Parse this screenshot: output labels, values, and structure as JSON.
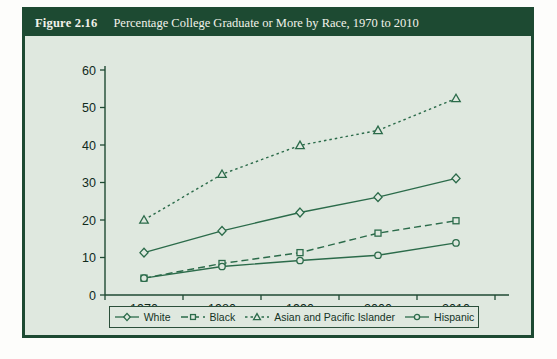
{
  "figure": {
    "number": "Figure 2.16",
    "title": "Percentage College Graduate or More by Race, 1970 to 2010"
  },
  "colors": {
    "header_bg": "#1d4a32",
    "header_text": "#f2f2ea",
    "panel_bg": "#dfe8df",
    "line": "#2b6b4a",
    "axis": "#1f4a33",
    "page_bg": "#fdfdfb"
  },
  "legend": {
    "position": "bottom",
    "entries": [
      {
        "label": "White",
        "marker": "diamond",
        "line_style": "solid"
      },
      {
        "label": "Black",
        "marker": "square",
        "line_style": "dashed"
      },
      {
        "label": "Asian and Pacific Islander",
        "marker": "triangle",
        "line_style": "dotted"
      },
      {
        "label": "Hispanic",
        "marker": "circle",
        "line_style": "solid"
      }
    ]
  },
  "chart_data": {
    "type": "line",
    "title": "Percentage College Graduate or More by Race, 1970 to 2010",
    "xlabel": "",
    "ylabel": "",
    "x": [
      1970,
      1980,
      1990,
      2000,
      2010
    ],
    "categories": [
      "1970",
      "1980",
      "1990",
      "2000",
      "2010"
    ],
    "xtick_labels": [
      "1970",
      "1980",
      "1990",
      "2000",
      "2010"
    ],
    "ytick_labels": [
      "0",
      "10",
      "20",
      "30",
      "40",
      "50",
      "60"
    ],
    "yticks": [
      0,
      10,
      20,
      30,
      40,
      50,
      60
    ],
    "ylim": [
      0,
      60
    ],
    "xlim": [
      1965,
      2015
    ],
    "grid": false,
    "legend_position": "bottom",
    "series": [
      {
        "name": "White",
        "marker": "diamond",
        "line_style": "solid",
        "values": [
          11.3,
          17.1,
          22.0,
          26.1,
          31.1
        ]
      },
      {
        "name": "Black",
        "marker": "square",
        "line_style": "dashed",
        "values": [
          4.5,
          8.4,
          11.3,
          16.5,
          19.8
        ]
      },
      {
        "name": "Asian and Pacific Islander",
        "marker": "triangle",
        "line_style": "dotted",
        "values": [
          20.0,
          32.2,
          39.9,
          43.9,
          52.4
        ]
      },
      {
        "name": "Hispanic",
        "marker": "circle",
        "line_style": "solid",
        "values": [
          4.5,
          7.6,
          9.2,
          10.6,
          13.9
        ]
      }
    ]
  },
  "bottom_note": ""
}
